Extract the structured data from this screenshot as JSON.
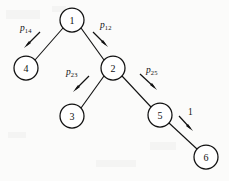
{
  "figure": {
    "type": "tree-diagram",
    "background_color": "#fbfbfa",
    "ink_color": "#111111",
    "nodes": [
      {
        "id": "1",
        "label": "1",
        "cx": 72,
        "cy": 20,
        "r": 12
      },
      {
        "id": "4",
        "label": "4",
        "cx": 26,
        "cy": 68,
        "r": 12
      },
      {
        "id": "2",
        "label": "2",
        "cx": 113,
        "cy": 68,
        "r": 12
      },
      {
        "id": "3",
        "label": "3",
        "cx": 72,
        "cy": 116,
        "r": 12
      },
      {
        "id": "5",
        "label": "5",
        "cx": 160,
        "cy": 115,
        "r": 12
      },
      {
        "id": "6",
        "label": "6",
        "cx": 206,
        "cy": 157,
        "r": 12
      }
    ],
    "edges": [
      {
        "from": "1",
        "to": "4",
        "label_base": "p",
        "label_sub": "14"
      },
      {
        "from": "1",
        "to": "2",
        "label_base": "p",
        "label_sub": "12"
      },
      {
        "from": "2",
        "to": "3",
        "label_base": "p",
        "label_sub": "23"
      },
      {
        "from": "2",
        "to": "5",
        "label_base": "p",
        "label_sub": "25"
      },
      {
        "from": "5",
        "to": "6",
        "label_base": "1",
        "label_sub": ""
      }
    ],
    "edge_labels": [
      {
        "key": "p14",
        "base": "p",
        "sub": "14",
        "x": 20,
        "y": 24
      },
      {
        "key": "p12",
        "base": "p",
        "sub": "12",
        "x": 100,
        "y": 21
      },
      {
        "key": "p23",
        "base": "p",
        "sub": "23",
        "x": 66,
        "y": 68
      },
      {
        "key": "p25",
        "base": "p",
        "sub": "25",
        "x": 146,
        "y": 66
      },
      {
        "key": "e56",
        "base": "1",
        "sub": "",
        "x": 188,
        "y": 108
      }
    ]
  }
}
